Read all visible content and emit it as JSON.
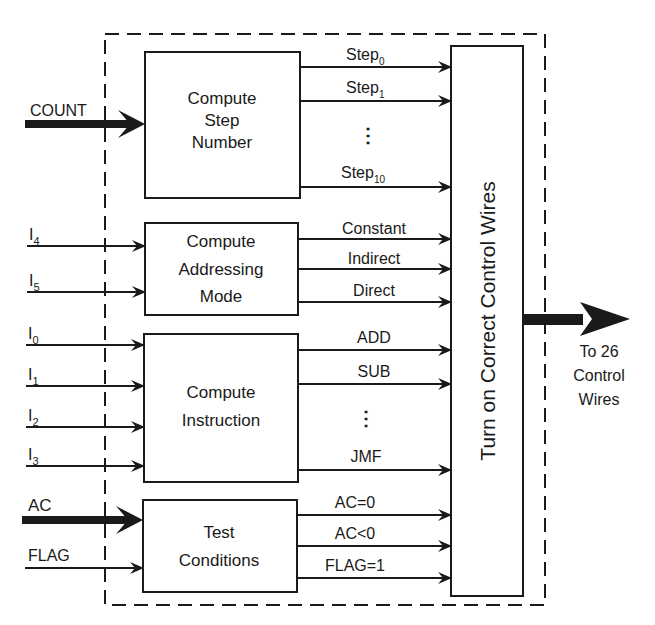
{
  "top_clipped_text": "",
  "colors": {
    "ink": "#1a1a1a",
    "background": "#ffffff"
  },
  "inputs": {
    "count": "COUNT",
    "i4": {
      "base": "I",
      "sub": "4"
    },
    "i5": {
      "base": "I",
      "sub": "5"
    },
    "i0": {
      "base": "I",
      "sub": "0"
    },
    "i1": {
      "base": "I",
      "sub": "1"
    },
    "i2": {
      "base": "I",
      "sub": "2"
    },
    "i3": {
      "base": "I",
      "sub": "3"
    },
    "ac": "AC",
    "flag": "FLAG"
  },
  "blocks": {
    "step": {
      "lines": [
        "Compute",
        "Step",
        "Number"
      ]
    },
    "addressing": {
      "lines": [
        "Compute",
        "Addressing",
        "Mode"
      ]
    },
    "instruction": {
      "lines": [
        "Compute",
        "Instruction"
      ]
    },
    "test": {
      "lines": [
        "Test",
        "Conditions"
      ]
    },
    "control": {
      "label": "Turn on Correct Control Wires"
    }
  },
  "signals": {
    "step0": {
      "base": "Step",
      "sub": "0"
    },
    "step1": {
      "base": "Step",
      "sub": "1"
    },
    "step_ellipsis": "⋮",
    "step10": {
      "base": "Step",
      "sub": "10"
    },
    "constant": "Constant",
    "indirect": "Indirect",
    "direct": "Direct",
    "add": "ADD",
    "sub": "SUB",
    "instr_ellipsis": "⋮",
    "jmf": "JMF",
    "ac_zero": "AC=0",
    "ac_neg": "AC<0",
    "flag_one": "FLAG=1"
  },
  "output": {
    "lines": [
      "To 26",
      "Control",
      "Wires"
    ]
  }
}
